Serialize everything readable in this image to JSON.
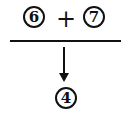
{
  "diagram": {
    "top_left_operand": "6",
    "operator": "+",
    "top_right_operand": "7",
    "result": "4",
    "colors": {
      "ink": "#111111",
      "background": "#ffffff"
    }
  }
}
